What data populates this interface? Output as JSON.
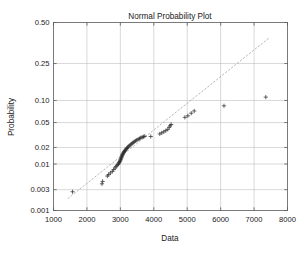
{
  "figure": {
    "background_color": "#ffffff",
    "title": "Normal Probability Plot",
    "xlabel": "Data",
    "ylabel": "Probability"
  },
  "axes": {
    "x_ticks": [
      "1000",
      "2000",
      "3000",
      "4000",
      "5000",
      "6000",
      "7000",
      "8000"
    ],
    "y_ticks": [
      "0.001",
      "0.003",
      "0.01",
      "0.02",
      "0.05",
      "0.10",
      "0.25",
      "0.50"
    ],
    "grid": "on",
    "grid_color": "#b9b9b9",
    "box_color": "#5a5a5a"
  },
  "chart_data": {
    "type": "scatter",
    "title": "Normal Probability Plot",
    "xlabel": "Data",
    "ylabel": "Probability",
    "xlim": [
      1000,
      8000
    ],
    "ylim": [
      0.001,
      0.5
    ],
    "yscale": "normal-probability",
    "grid": true,
    "legend": "none",
    "marker": "+",
    "marker_color": "#2b2b2b",
    "x_tick_values": [
      1000,
      2000,
      3000,
      4000,
      5000,
      6000,
      7000,
      8000
    ],
    "y_tick_values": [
      0.001,
      0.003,
      0.01,
      0.02,
      0.05,
      0.1,
      0.25,
      0.5
    ],
    "reference_line": {
      "style": "dashed",
      "color": "#8e8e8e",
      "x": [
        1430,
        7450
      ],
      "y": [
        0.0019,
        0.4
      ]
    },
    "x": [
      1570,
      2450,
      2470,
      2610,
      2650,
      2700,
      2760,
      2800,
      2840,
      2870,
      2900,
      2930,
      2950,
      2965,
      2980,
      2995,
      3005,
      3015,
      3025,
      3035,
      3045,
      3055,
      3065,
      3075,
      3090,
      3105,
      3120,
      3135,
      3150,
      3170,
      3190,
      3210,
      3235,
      3260,
      3290,
      3320,
      3350,
      3380,
      3415,
      3450,
      3490,
      3530,
      3570,
      3610,
      3650,
      3690,
      3730,
      3910,
      4180,
      4240,
      4300,
      4360,
      4420,
      4460,
      4490,
      4520,
      4930,
      5020,
      5120,
      5210,
      6100,
      7350
    ],
    "y": [
      0.0027,
      0.004,
      0.0045,
      0.0058,
      0.0062,
      0.0067,
      0.0072,
      0.0078,
      0.0084,
      0.0089,
      0.0094,
      0.0098,
      0.0103,
      0.0107,
      0.0111,
      0.0115,
      0.012,
      0.0124,
      0.0129,
      0.0134,
      0.0139,
      0.0144,
      0.015,
      0.0155,
      0.016,
      0.0165,
      0.017,
      0.0175,
      0.018,
      0.0186,
      0.0192,
      0.0198,
      0.0205,
      0.0212,
      0.0219,
      0.0226,
      0.0234,
      0.0242,
      0.025,
      0.0258,
      0.0266,
      0.0274,
      0.0282,
      0.029,
      0.0297,
      0.0303,
      0.0308,
      0.0305,
      0.0335,
      0.0348,
      0.0362,
      0.0378,
      0.0395,
      0.0425,
      0.0448,
      0.0468,
      0.0595,
      0.0625,
      0.068,
      0.073,
      0.0855,
      0.11
    ],
    "n_points": 62,
    "annotations": [
      {
        "label": "high outliers right of reference line",
        "x": [
          6100,
          7350
        ],
        "y": [
          0.0855,
          0.11
        ]
      }
    ]
  }
}
